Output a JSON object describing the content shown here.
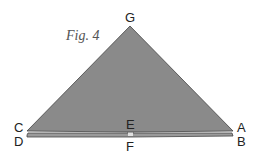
{
  "figure": {
    "caption": "Fig. 4",
    "labels": {
      "G": "G",
      "C": "C",
      "D": "D",
      "E": "E",
      "F": "F",
      "A": "A",
      "B": "B"
    },
    "colors": {
      "fill": "#8a8a8a",
      "stroke": "#444444",
      "strip": "#9a9a9a",
      "gap": "#e0e0e0"
    }
  }
}
